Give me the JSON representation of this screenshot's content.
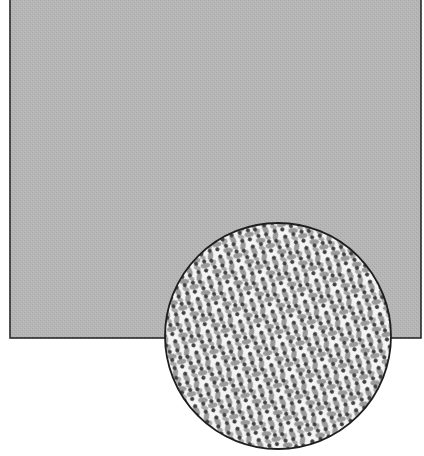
{
  "figure": {
    "panel": {
      "x": 10,
      "y": -2,
      "width": 411,
      "height": 340,
      "fill": "#b4b4b4",
      "border": "#2a2a2a"
    },
    "inset": {
      "cx": 278,
      "cy": 336,
      "r": 113,
      "background": "#f4f4f4",
      "dot_color": "#444444",
      "blob_color": "#8a8a8a",
      "border": "#1e1e1e"
    }
  }
}
